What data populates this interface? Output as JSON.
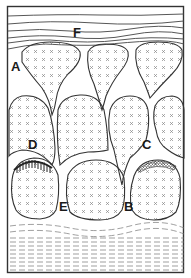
{
  "diagram": {
    "colors": {
      "outline": "#333333",
      "fill": "#ffffff",
      "pattern_mark": "#777777",
      "background": "#ffffff"
    },
    "labels": [
      {
        "id": "F",
        "text": "F",
        "x": 73,
        "y": 26
      },
      {
        "id": "A",
        "text": "A",
        "x": 11,
        "y": 60
      },
      {
        "id": "D",
        "text": "D",
        "x": 28,
        "y": 138
      },
      {
        "id": "C",
        "text": "C",
        "x": 142,
        "y": 138
      },
      {
        "id": "E",
        "text": "E",
        "x": 59,
        "y": 200
      },
      {
        "id": "B",
        "text": "B",
        "x": 124,
        "y": 200
      }
    ],
    "legend": {
      "x_pattern": "pillow body (crossed marks)",
      "wavy_lines": "laminated top layer",
      "dashed_lines": "sediment base layer",
      "hatched_cap": "structure D",
      "stippled_cap": "structure C"
    }
  }
}
